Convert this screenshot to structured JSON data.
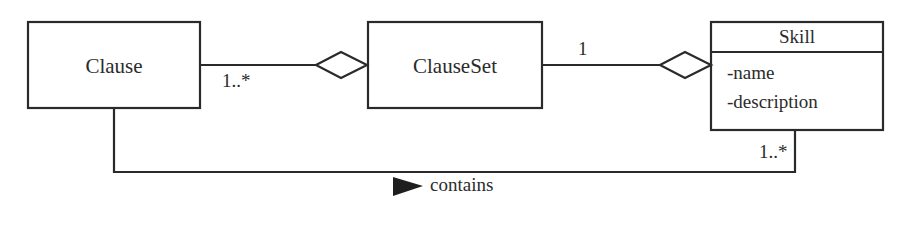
{
  "diagram": {
    "type": "uml-class-diagram",
    "classes": [
      {
        "id": "clause",
        "name": "Clause",
        "attributes": []
      },
      {
        "id": "clauseset",
        "name": "ClauseSet",
        "attributes": []
      },
      {
        "id": "skill",
        "name": "Skill",
        "attributes": [
          "-name",
          "-description"
        ]
      }
    ],
    "relationships": [
      {
        "type": "aggregation",
        "from": "Clause",
        "to": "ClauseSet",
        "multiplicity_part": "1..*"
      },
      {
        "type": "aggregation",
        "from": "ClauseSet",
        "to": "Skill",
        "multiplicity_part": "1"
      },
      {
        "type": "association",
        "from": "Clause",
        "to": "Skill",
        "label": "contains",
        "multiplicity_skill_end": "1..*"
      }
    ],
    "stroke_color": "#2a2a2a",
    "background": "#ffffff"
  }
}
